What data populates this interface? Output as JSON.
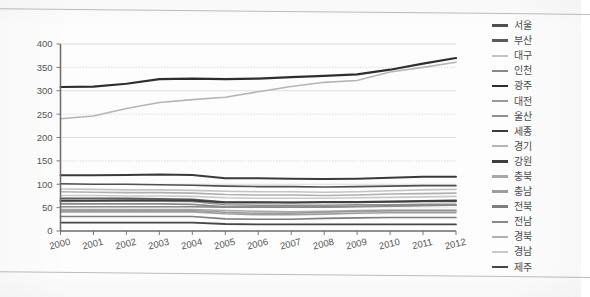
{
  "chart_data": {
    "type": "line",
    "title": "",
    "xlabel": "",
    "ylabel": "",
    "grid": true,
    "legend_position": "right",
    "x": [
      2000,
      2001,
      2002,
      2003,
      2004,
      2005,
      2006,
      2007,
      2008,
      2009,
      2010,
      2011,
      2012
    ],
    "xtick_labels": [
      "2000",
      "2001",
      "2002",
      "2003",
      "2004",
      "2005",
      "2006",
      "2007",
      "2008",
      "2009",
      "2010",
      "2011",
      "2012"
    ],
    "ytick_labels": [
      "0",
      "50",
      "100",
      "150",
      "200",
      "250",
      "300",
      "350",
      "400"
    ],
    "yticks": [
      0,
      50,
      100,
      150,
      200,
      250,
      300,
      350,
      400
    ],
    "ylim": [
      0,
      400
    ],
    "series": [
      {
        "name": "서울",
        "color": "#4f4f4f",
        "width": 1.6,
        "values": [
          101,
          100,
          100,
          99,
          98,
          96,
          95,
          95,
          94,
          95,
          96,
          97,
          97
        ]
      },
      {
        "name": "부산",
        "color": "#5b5b5b",
        "width": 1.6,
        "values": [
          70,
          70,
          70,
          69,
          68,
          62,
          62,
          61,
          61,
          61,
          62,
          63,
          63
        ]
      },
      {
        "name": "대구",
        "color": "#c3c3c3",
        "width": 1.6,
        "values": [
          90,
          89,
          88,
          88,
          87,
          85,
          84,
          84,
          83,
          84,
          86,
          88,
          89
        ]
      },
      {
        "name": "인천",
        "color": "#8a8a8a",
        "width": 1.6,
        "values": [
          52,
          52,
          52,
          52,
          52,
          51,
          51,
          51,
          51,
          52,
          53,
          54,
          55
        ]
      },
      {
        "name": "광주",
        "color": "#2e2e2e",
        "width": 2.2,
        "values": [
          308,
          309,
          315,
          325,
          326,
          325,
          326,
          329,
          332,
          335,
          345,
          358,
          370
        ]
      },
      {
        "name": "대전",
        "color": "#9a9a9a",
        "width": 1.6,
        "values": [
          44,
          44,
          44,
          44,
          44,
          40,
          38,
          38,
          40,
          42,
          43,
          43,
          43
        ]
      },
      {
        "name": "울산",
        "color": "#8f8f8f",
        "width": 1.6,
        "values": [
          63,
          64,
          64,
          64,
          63,
          56,
          55,
          55,
          55,
          56,
          56,
          57,
          57
        ]
      },
      {
        "name": "세종",
        "color": "#3a3a3a",
        "width": 2.0,
        "values": [
          119,
          119,
          120,
          121,
          120,
          113,
          113,
          112,
          111,
          112,
          114,
          116,
          116
        ]
      },
      {
        "name": "경기",
        "color": "#b5b5b5",
        "width": 1.6,
        "values": [
          240,
          246,
          262,
          275,
          281,
          286,
          298,
          309,
          318,
          322,
          340,
          350,
          361
        ]
      },
      {
        "name": "강원",
        "color": "#3f3f3f",
        "width": 2.0,
        "values": [
          65,
          65,
          66,
          66,
          65,
          61,
          61,
          61,
          62,
          62,
          63,
          64,
          65
        ]
      },
      {
        "name": "충북",
        "color": "#a8a8a8",
        "width": 1.6,
        "values": [
          46,
          46,
          46,
          46,
          46,
          44,
          42,
          41,
          42,
          44,
          45,
          45,
          45
        ]
      },
      {
        "name": "충남",
        "color": "#9e9e9e",
        "width": 1.6,
        "values": [
          41,
          41,
          41,
          41,
          41,
          37,
          35,
          35,
          36,
          38,
          39,
          39,
          39
        ]
      },
      {
        "name": "전북",
        "color": "#7e7e7e",
        "width": 1.6,
        "values": [
          31,
          31,
          31,
          31,
          31,
          26,
          25,
          25,
          27,
          28,
          29,
          29,
          29
        ]
      },
      {
        "name": "전남",
        "color": "#8b8b8b",
        "width": 1.6,
        "values": [
          58,
          58,
          58,
          58,
          57,
          52,
          51,
          51,
          52,
          53,
          54,
          55,
          55
        ]
      },
      {
        "name": "경북",
        "color": "#b0b0b0",
        "width": 1.6,
        "values": [
          84,
          83,
          82,
          82,
          81,
          78,
          77,
          77,
          76,
          77,
          79,
          80,
          81
        ]
      },
      {
        "name": "경남",
        "color": "#c9c9c9",
        "width": 1.6,
        "values": [
          76,
          76,
          75,
          75,
          74,
          71,
          70,
          70,
          70,
          71,
          72,
          73,
          74
        ]
      },
      {
        "name": "제주",
        "color": "#474747",
        "width": 1.8,
        "values": [
          18,
          18,
          18,
          18,
          18,
          15,
          14,
          14,
          14,
          14,
          14,
          14,
          14
        ]
      }
    ]
  },
  "legend": {
    "items": [
      {
        "label": "서울"
      },
      {
        "label": "부산"
      },
      {
        "label": "대구"
      },
      {
        "label": "인천"
      },
      {
        "label": "광주"
      },
      {
        "label": "대전"
      },
      {
        "label": "울산"
      },
      {
        "label": "세종"
      },
      {
        "label": "경기"
      },
      {
        "label": "강원"
      },
      {
        "label": "충북"
      },
      {
        "label": "충남"
      },
      {
        "label": "전북"
      },
      {
        "label": "전남"
      },
      {
        "label": "경북"
      },
      {
        "label": "경남"
      },
      {
        "label": "제주"
      }
    ]
  },
  "colors": {
    "axis": "#6b6b6b",
    "grid": "#d6d6d6",
    "grid_dotted": "#cfcfcf",
    "text": "#555555",
    "scan_rule": "#bdbdbd",
    "page": "#fdfdfd"
  }
}
